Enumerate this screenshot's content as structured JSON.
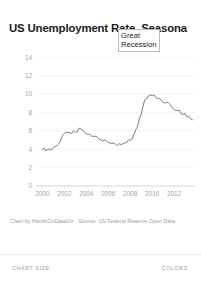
{
  "chart_card": {
    "title": "US Unemployment Rate, Seasona",
    "credit": "Chart by HandsOnDataViz · Source: US Federal Reserve Open Data",
    "annotation": {
      "line1": "Great",
      "line2": "Recession"
    }
  },
  "bottom_bar": {
    "chart_size_label": "CHART SIZE",
    "colors_label": "COLORS"
  },
  "colors": {
    "line": "#6e6e6e",
    "grid": "#f4f4f4",
    "axis": "#d8d8d8",
    "tick_text": "#a3a3a3",
    "title_text": "#1b1b1b",
    "credit_text": "#9a9a9a",
    "annotation_border": "#b9b9b9",
    "background": "#ffffff"
  },
  "chart_data": {
    "type": "line",
    "title": "US Unemployment Rate, Seasona",
    "xlabel": "",
    "ylabel": "",
    "xlim": [
      1999.6,
      2013.9
    ],
    "ylim": [
      0,
      15
    ],
    "grid": true,
    "legend": "none",
    "y_ticks": [
      0,
      2,
      4,
      6,
      8,
      10,
      12,
      14
    ],
    "x_ticks": [
      2000,
      2002,
      2004,
      2006,
      2008,
      2010,
      2012
    ],
    "annotations": [
      {
        "text": "Great Recession",
        "x": 2008.9,
        "y": 10.6
      }
    ],
    "series": [
      {
        "name": "US Unemployment Rate (Seasonally Adjusted)",
        "x": [
          2000.0,
          2000.17,
          2000.33,
          2000.5,
          2000.67,
          2000.83,
          2001.0,
          2001.17,
          2001.33,
          2001.5,
          2001.67,
          2001.83,
          2002.0,
          2002.17,
          2002.33,
          2002.5,
          2002.67,
          2002.83,
          2003.0,
          2003.17,
          2003.33,
          2003.5,
          2003.67,
          2003.83,
          2004.0,
          2004.17,
          2004.33,
          2004.5,
          2004.67,
          2004.83,
          2005.0,
          2005.17,
          2005.33,
          2005.5,
          2005.67,
          2005.83,
          2006.0,
          2006.17,
          2006.33,
          2006.5,
          2006.67,
          2006.83,
          2007.0,
          2007.17,
          2007.33,
          2007.5,
          2007.67,
          2007.83,
          2008.0,
          2008.17,
          2008.33,
          2008.5,
          2008.67,
          2008.83,
          2009.0,
          2009.17,
          2009.33,
          2009.5,
          2009.67,
          2009.83,
          2010.0,
          2010.17,
          2010.33,
          2010.5,
          2010.67,
          2010.83,
          2011.0,
          2011.17,
          2011.33,
          2011.5,
          2011.67,
          2011.83,
          2012.0,
          2012.17,
          2012.33,
          2012.5,
          2012.67,
          2012.83,
          2013.0,
          2013.17,
          2013.33,
          2013.5,
          2013.67
        ],
        "y": [
          4.0,
          4.1,
          3.8,
          4.0,
          4.0,
          3.9,
          4.2,
          4.3,
          4.4,
          4.6,
          5.0,
          5.5,
          5.7,
          5.9,
          5.8,
          5.8,
          5.7,
          6.0,
          5.8,
          5.9,
          6.3,
          6.2,
          6.1,
          5.8,
          5.7,
          5.6,
          5.6,
          5.4,
          5.4,
          5.4,
          5.3,
          5.1,
          5.0,
          4.9,
          5.0,
          4.9,
          4.7,
          4.7,
          4.6,
          4.7,
          4.5,
          4.4,
          4.6,
          4.5,
          4.6,
          4.7,
          4.7,
          5.0,
          5.0,
          5.1,
          5.6,
          6.1,
          6.5,
          7.3,
          7.8,
          8.7,
          9.4,
          9.5,
          9.8,
          9.9,
          9.8,
          9.9,
          9.6,
          9.5,
          9.5,
          9.3,
          9.1,
          9.0,
          9.1,
          9.0,
          8.8,
          8.5,
          8.3,
          8.2,
          8.2,
          8.2,
          7.8,
          7.8,
          7.9,
          7.5,
          7.6,
          7.3,
          7.2
        ]
      }
    ]
  }
}
